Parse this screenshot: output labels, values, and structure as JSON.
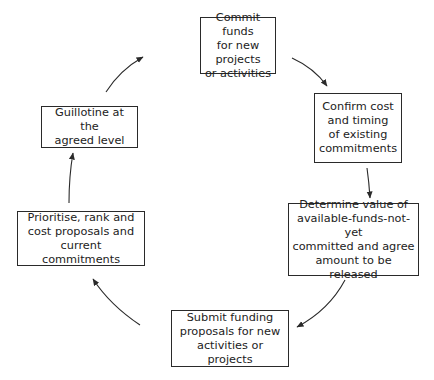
{
  "diagram": {
    "type": "cycle",
    "nodes": [
      {
        "id": "commit",
        "label": "Commit funds\nfor new projects\nor activities"
      },
      {
        "id": "confirm",
        "label": "Confirm cost\nand timing\nof existing\ncommitments"
      },
      {
        "id": "determine",
        "label": "Determine value of\navailable-funds-not-yet\ncommitted and agree\namount to be released"
      },
      {
        "id": "submit",
        "label": "Submit funding\nproposals for new\nactivities or projects"
      },
      {
        "id": "prioritise",
        "label": "Prioritise, rank and\ncost proposals and\ncurrent commitments"
      },
      {
        "id": "guillotine",
        "label": "Guillotine at the\nagreed level"
      }
    ],
    "edges": [
      {
        "from": "commit",
        "to": "confirm"
      },
      {
        "from": "confirm",
        "to": "determine"
      },
      {
        "from": "determine",
        "to": "submit"
      },
      {
        "from": "submit",
        "to": "prioritise"
      },
      {
        "from": "prioritise",
        "to": "guillotine"
      },
      {
        "from": "guillotine",
        "to": "commit"
      }
    ],
    "colors": {
      "stroke": "#2a2a2a",
      "text": "#222222",
      "background": "#ffffff"
    }
  }
}
